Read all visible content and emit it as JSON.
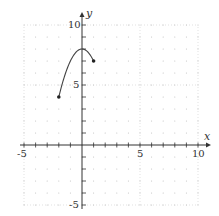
{
  "chart_data": {
    "type": "line",
    "title": "",
    "xlabel": "x",
    "ylabel": "y",
    "xlim": [
      -5,
      10
    ],
    "ylim": [
      -5,
      10
    ],
    "x_ticks_labeled": [
      "-5",
      "5",
      "10"
    ],
    "y_ticks_labeled": [
      "10",
      "5",
      "-5"
    ],
    "grid": true,
    "grid_style": "dotted",
    "series": [
      {
        "name": "f(x) = 8 - x^2",
        "x": [
          -2,
          -1.5,
          -1,
          -0.5,
          0,
          0.5,
          1
        ],
        "y": [
          4,
          5.75,
          7,
          7.75,
          8,
          7.75,
          7
        ],
        "endpoints": [
          {
            "x": -2,
            "y": 4,
            "style": "closed"
          },
          {
            "x": 1,
            "y": 7,
            "style": "closed"
          }
        ],
        "peak": {
          "x": 0,
          "y": 8
        }
      }
    ]
  },
  "labels": {
    "x_axis": "x",
    "y_axis": "y",
    "x_neg5": "-5",
    "x_5": "5",
    "x_10": "10",
    "y_10": "10",
    "y_5": "5",
    "y_neg5": "-5"
  }
}
